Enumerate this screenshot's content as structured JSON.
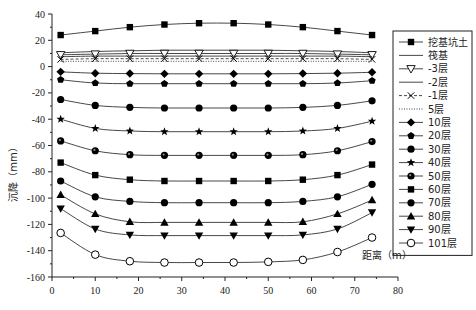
{
  "chart_data": {
    "type": "line",
    "title": "",
    "xlabel": "距离（m）",
    "ylabel": "沉降（mm）",
    "xlim": [
      0,
      80
    ],
    "ylim": [
      -160,
      40
    ],
    "xticks": [
      0,
      10,
      20,
      30,
      40,
      50,
      60,
      70,
      80
    ],
    "yticks": [
      40,
      20,
      0,
      -20,
      -40,
      -60,
      -80,
      -100,
      -120,
      -140,
      -160
    ],
    "grid": false,
    "legend_position": "right",
    "x": [
      2,
      10,
      18,
      26,
      34,
      42,
      50,
      58,
      66,
      74
    ],
    "series": [
      {
        "name": "挖基坑土",
        "marker": "square",
        "line": "solid",
        "values": [
          24,
          27,
          30,
          32,
          33,
          33,
          32,
          30,
          27,
          24
        ]
      },
      {
        "name": "筏基",
        "marker": "none",
        "line": "solid",
        "values": [
          10.5,
          11.5,
          12,
          12.5,
          12.5,
          12.5,
          12.5,
          12,
          11.5,
          10.5
        ]
      },
      {
        "name": "-3层",
        "marker": "triangle-down-open",
        "line": "solid",
        "values": [
          9,
          9.5,
          10,
          10,
          10,
          10,
          10,
          10,
          9.5,
          9
        ]
      },
      {
        "name": "-2层",
        "marker": "none",
        "line": "solid",
        "values": [
          7.5,
          8,
          8,
          8,
          8,
          8,
          8,
          8,
          8,
          7.5
        ]
      },
      {
        "name": "-1层",
        "marker": "x",
        "line": "dashed",
        "values": [
          5.5,
          6,
          6,
          6,
          6,
          6,
          6,
          6,
          6,
          5.5
        ]
      },
      {
        "name": "5层",
        "marker": "none",
        "line": "dotted",
        "values": [
          4,
          4,
          4,
          4,
          4,
          4,
          4,
          4,
          4,
          4
        ]
      },
      {
        "name": "10层",
        "marker": "diamond",
        "line": "solid",
        "values": [
          -4,
          -5,
          -5.3,
          -5.5,
          -5.5,
          -5.5,
          -5.5,
          -5.3,
          -5,
          -4.3
        ]
      },
      {
        "name": "20层",
        "marker": "pentagon",
        "line": "solid",
        "values": [
          -10,
          -12.5,
          -13,
          -13,
          -13,
          -13,
          -13,
          -13,
          -12.5,
          -10.7
        ]
      },
      {
        "name": "30层",
        "marker": "circle",
        "line": "solid",
        "values": [
          -25,
          -29.5,
          -31,
          -31.5,
          -31.5,
          -31.5,
          -31.5,
          -31,
          -29.5,
          -26
        ]
      },
      {
        "name": "40层",
        "marker": "star",
        "line": "solid",
        "values": [
          -40,
          -47,
          -49,
          -49.5,
          -49.5,
          -49.5,
          -49.5,
          -49,
          -47,
          -41.5
        ]
      },
      {
        "name": "50层",
        "marker": "circle-dot",
        "line": "solid",
        "values": [
          -56.5,
          -64,
          -67,
          -67.5,
          -67.5,
          -67.5,
          -67.5,
          -67,
          -64,
          -57
        ]
      },
      {
        "name": "60层",
        "marker": "square",
        "line": "solid",
        "values": [
          -73,
          -82.5,
          -86,
          -87,
          -87,
          -87,
          -87,
          -86,
          -82.5,
          -74.5
        ]
      },
      {
        "name": "70层",
        "marker": "circle",
        "line": "solid",
        "values": [
          -87,
          -99,
          -102.5,
          -103.5,
          -103.5,
          -103.5,
          -103.5,
          -102.5,
          -99,
          -89.5
        ]
      },
      {
        "name": "80层",
        "marker": "triangle-up",
        "line": "solid",
        "values": [
          -97.5,
          -112,
          -118,
          -118.5,
          -118.5,
          -118.5,
          -118.5,
          -118,
          -112,
          -101.5
        ]
      },
      {
        "name": "90层",
        "marker": "triangle-down",
        "line": "solid",
        "values": [
          -108,
          -123.5,
          -128,
          -128.5,
          -128.5,
          -128.5,
          -128.5,
          -128,
          -123.5,
          -111
        ]
      },
      {
        "name": "101层",
        "marker": "circle-open",
        "line": "solid",
        "values": [
          -126.5,
          -143,
          -148,
          -149,
          -149,
          -149,
          -148.5,
          -147,
          -141,
          -130
        ]
      }
    ]
  },
  "colors": {
    "line": "#333333",
    "marker": "#000000",
    "axis": "#222222",
    "background": "#ffffff"
  }
}
